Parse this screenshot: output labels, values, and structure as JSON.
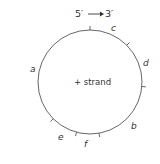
{
  "diagram": {
    "direction": {
      "from": "5′",
      "to": "3′"
    },
    "center_label": "+ strand",
    "circle": {
      "cx": 90,
      "cy": 82,
      "r": 52,
      "stroke": "#555555"
    },
    "labels": [
      {
        "id": "a",
        "text": "a",
        "x": 30,
        "y": 72
      },
      {
        "id": "b",
        "text": "b",
        "x": 131,
        "y": 129
      },
      {
        "id": "c",
        "text": "c",
        "x": 111,
        "y": 31
      },
      {
        "id": "d",
        "text": "d",
        "x": 143,
        "y": 66
      },
      {
        "id": "e",
        "text": "e",
        "x": 58,
        "y": 140
      },
      {
        "id": "f",
        "text": "f",
        "x": 84,
        "y": 147
      }
    ],
    "ticks_deg": [
      -90,
      -45,
      5,
      135,
      105,
      80
    ]
  }
}
